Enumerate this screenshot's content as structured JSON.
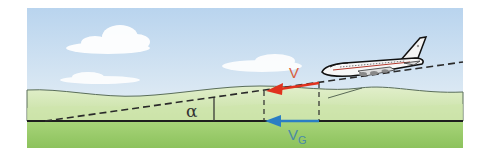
{
  "diagram": {
    "labels": {
      "angle": "α",
      "airspeed": "V",
      "groundspeed_main": "V",
      "groundspeed_sub": "G"
    },
    "colors": {
      "sky_top": "#bcd6ee",
      "sky_bottom": "#e4eef4",
      "hill_far": "#dcebc4",
      "hill_near": "#c8e2a4",
      "ground": "#9ccb6c",
      "airspeed_arrow": "#e0321e",
      "groundspeed_arrow": "#2a7ec4",
      "airspeed_label": "#d9603e",
      "groundspeed_label": "#4a8aa8",
      "line": "#222222"
    }
  }
}
